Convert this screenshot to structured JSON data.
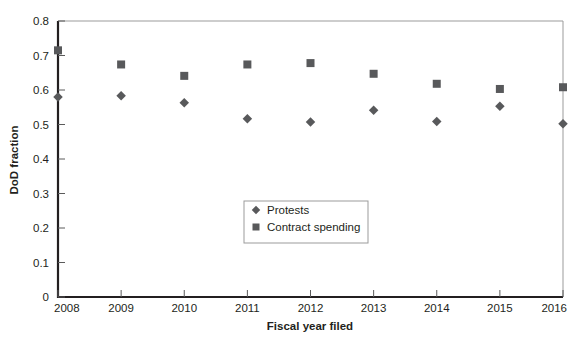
{
  "chart_data": {
    "type": "scatter",
    "title": "",
    "xlabel": "Fiscal year filed",
    "ylabel": "DoD fraction",
    "categories": [
      2008,
      2009,
      2010,
      2011,
      2012,
      2013,
      2014,
      2015,
      2016
    ],
    "x_tick_labels": [
      "2008",
      "2009",
      "2010",
      "2011",
      "2012",
      "2013",
      "2014",
      "2015",
      "2016"
    ],
    "y_tick_labels": [
      "0",
      "0.1",
      "0.2",
      "0.3",
      "0.4",
      "0.5",
      "0.6",
      "0.7",
      "0.8"
    ],
    "y_tick_values": [
      0,
      0.1,
      0.2,
      0.3,
      0.4,
      0.5,
      0.6,
      0.7,
      0.8
    ],
    "xlim": [
      2008,
      2016
    ],
    "ylim": [
      0,
      0.8
    ],
    "grid": false,
    "legend_position": "center",
    "series": [
      {
        "name": "Protests",
        "marker": "diamond",
        "color": "#58595b",
        "values": [
          0.58,
          0.583,
          0.563,
          0.517,
          0.507,
          0.541,
          0.509,
          0.553,
          0.502
        ]
      },
      {
        "name": "Contract spending",
        "marker": "square",
        "color": "#58595b",
        "values": [
          0.715,
          0.674,
          0.641,
          0.674,
          0.678,
          0.647,
          0.618,
          0.603,
          0.608
        ]
      }
    ],
    "axis_color": "#231f20",
    "frame_color": "#9b9b9b"
  },
  "legend": {
    "items": [
      {
        "label": "Protests",
        "marker": "diamond"
      },
      {
        "label": "Contract spending",
        "marker": "square"
      }
    ]
  }
}
